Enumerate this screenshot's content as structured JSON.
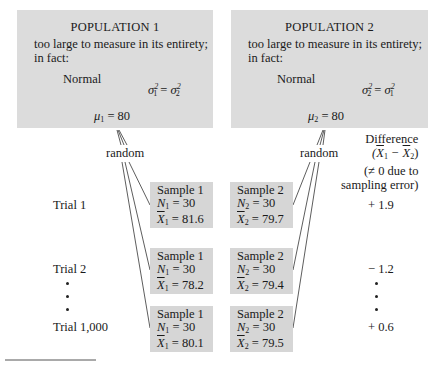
{
  "populations": [
    {
      "title": "POPULATION 1",
      "desc_line1": "too large to measure in its entirety;",
      "desc_line2": "in fact:",
      "distribution": "Normal",
      "variance_lhs_sub": "1",
      "variance_rhs_sub": "2",
      "mean_sub": "1",
      "mean_value": "80"
    },
    {
      "title": "POPULATION 2",
      "desc_line1": "too large to measure in its entirety;",
      "desc_line2": "in fact:",
      "distribution": "Normal",
      "variance_lhs_sub": "2",
      "variance_rhs_sub": "1",
      "mean_sub": "2",
      "mean_value": "80"
    }
  ],
  "random_label": "random",
  "difference_header": {
    "line1": "Difference",
    "line2": "(X̄1 − X̄2)",
    "line3": "(≠ 0 due to",
    "line4": "sampling error)"
  },
  "trials": [
    {
      "label": "Trial 1",
      "sample1": {
        "title": "Sample 1",
        "n": "30",
        "mean": "81.6"
      },
      "sample2": {
        "title": "Sample 2",
        "n": "30",
        "mean": "79.7"
      },
      "difference": "+ 1.9"
    },
    {
      "label": "Trial 2",
      "sample1": {
        "title": "Sample 1",
        "n": "30",
        "mean": "78.2"
      },
      "sample2": {
        "title": "Sample 2",
        "n": "30",
        "mean": "79.4"
      },
      "difference": "− 1.2"
    },
    {
      "label": "Trial 1,000",
      "sample1": {
        "title": "Sample 1",
        "n": "30",
        "mean": "80.1"
      },
      "sample2": {
        "title": "Sample 2",
        "n": "30",
        "mean": "79.5"
      },
      "difference": "+ 0.6"
    }
  ],
  "symbols": {
    "mu": "μ",
    "sigma": "σ",
    "N": "N",
    "X": "X",
    "equals": " = ",
    "sq": "2"
  }
}
